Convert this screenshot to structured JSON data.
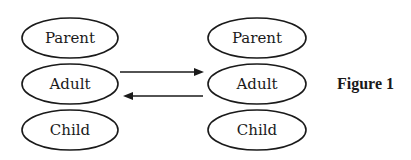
{
  "diagram": {
    "left_column": {
      "states": [
        {
          "label": "Parent"
        },
        {
          "label": "Adult"
        },
        {
          "label": "Child"
        }
      ]
    },
    "right_column": {
      "states": [
        {
          "label": "Parent"
        },
        {
          "label": "Adult"
        },
        {
          "label": "Child"
        }
      ]
    },
    "arrows": [
      {
        "from": "left.Adult",
        "to": "right.Adult",
        "direction": "right"
      },
      {
        "from": "right.Adult",
        "to": "left.Adult",
        "direction": "left"
      }
    ],
    "caption": "Figure 1",
    "colors": {
      "stroke": "#1a1a1a",
      "background": "#ffffff"
    }
  }
}
